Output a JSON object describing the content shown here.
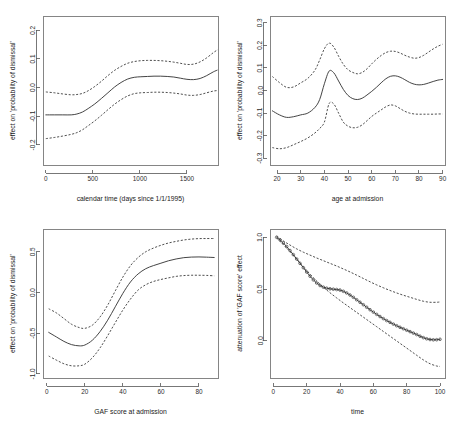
{
  "figure": {
    "title": "",
    "layout": "2x2 panel of smooth term effect plots with pointwise confidence bands",
    "background_color": "#ffffff",
    "line_color": "#3a3a3a"
  },
  "chart_data": [
    {
      "id": "calendar-time",
      "type": "line",
      "title": "",
      "xlabel": "calendar time (days since 1/1/1995)",
      "ylabel": "effect on 'probability of dismissal'",
      "xlim": [
        -30,
        1830
      ],
      "ylim": [
        -0.27,
        0.25
      ],
      "xticks": [
        0,
        500,
        1000,
        1500
      ],
      "xtick_labels": [
        "0",
        "500",
        "1000",
        "1500"
      ],
      "yticks": [
        0.2,
        0.1,
        0.0,
        -0.1,
        -0.2
      ],
      "ytick_labels": [
        "0.2",
        "0.1",
        "0.0",
        "-0.1",
        "-0.2"
      ],
      "grid": false,
      "legend": "none",
      "series": [
        {
          "name": "fit",
          "style": "solid",
          "x": [
            0,
            90,
            180,
            270,
            330,
            390,
            450,
            520,
            590,
            660,
            730,
            800,
            870,
            940,
            1010,
            1080,
            1150,
            1220,
            1290,
            1360,
            1430,
            1500,
            1570,
            1640,
            1710,
            1780,
            1830
          ],
          "values": [
            -0.095,
            -0.095,
            -0.095,
            -0.095,
            -0.092,
            -0.085,
            -0.073,
            -0.057,
            -0.038,
            -0.018,
            0.002,
            0.018,
            0.03,
            0.036,
            0.038,
            0.039,
            0.04,
            0.04,
            0.039,
            0.037,
            0.033,
            0.029,
            0.028,
            0.032,
            0.042,
            0.055,
            0.062
          ]
        },
        {
          "name": "upper confidence band",
          "style": "dashed",
          "x": [
            0,
            90,
            180,
            270,
            330,
            390,
            450,
            520,
            590,
            660,
            730,
            800,
            870,
            940,
            1010,
            1080,
            1150,
            1220,
            1290,
            1360,
            1430,
            1500,
            1570,
            1640,
            1710,
            1780,
            1830
          ],
          "values": [
            -0.015,
            -0.018,
            -0.022,
            -0.025,
            -0.024,
            -0.02,
            -0.011,
            0.004,
            0.022,
            0.042,
            0.06,
            0.074,
            0.085,
            0.091,
            0.094,
            0.095,
            0.095,
            0.094,
            0.092,
            0.089,
            0.085,
            0.081,
            0.082,
            0.09,
            0.104,
            0.122,
            0.133
          ]
        },
        {
          "name": "lower confidence band",
          "style": "dashed",
          "x": [
            0,
            90,
            180,
            270,
            330,
            390,
            450,
            520,
            590,
            660,
            730,
            800,
            870,
            940,
            1010,
            1080,
            1150,
            1220,
            1290,
            1360,
            1430,
            1500,
            1570,
            1640,
            1710,
            1780,
            1830
          ],
          "values": [
            -0.178,
            -0.174,
            -0.169,
            -0.163,
            -0.157,
            -0.147,
            -0.133,
            -0.116,
            -0.097,
            -0.077,
            -0.058,
            -0.042,
            -0.029,
            -0.021,
            -0.018,
            -0.017,
            -0.016,
            -0.016,
            -0.017,
            -0.019,
            -0.022,
            -0.026,
            -0.027,
            -0.024,
            -0.018,
            -0.012,
            -0.01
          ]
        }
      ]
    },
    {
      "id": "age-at-admission",
      "type": "line",
      "title": "",
      "xlabel": "age at admission",
      "ylabel": "effect on 'probability of dismissal'",
      "xlim": [
        17,
        91
      ],
      "ylim": [
        -0.33,
        0.33
      ],
      "xticks": [
        20,
        30,
        40,
        50,
        60,
        70,
        80,
        90
      ],
      "xtick_labels": [
        "20",
        "30",
        "40",
        "50",
        "60",
        "70",
        "80",
        "90"
      ],
      "yticks": [
        0.3,
        0.2,
        0.1,
        0.0,
        -0.1,
        -0.2,
        -0.3
      ],
      "ytick_labels": [
        "0.3",
        "0.2",
        "0.1",
        "0.0",
        "-0.1",
        "-0.2",
        "-0.3"
      ],
      "grid": false,
      "legend": "none",
      "series": [
        {
          "name": "fit",
          "style": "solid",
          "x": [
            18,
            21,
            24,
            27,
            30,
            33,
            36,
            38,
            40,
            42,
            44,
            46,
            48,
            50,
            52,
            54,
            56,
            58,
            60,
            62,
            64,
            66,
            68,
            70,
            72,
            74,
            76,
            78,
            80,
            82,
            84,
            86,
            88,
            90
          ],
          "values": [
            -0.09,
            -0.108,
            -0.119,
            -0.116,
            -0.108,
            -0.1,
            -0.075,
            -0.04,
            0.03,
            0.086,
            0.078,
            0.042,
            0.005,
            -0.022,
            -0.036,
            -0.04,
            -0.034,
            -0.02,
            -0.004,
            0.014,
            0.034,
            0.052,
            0.063,
            0.065,
            0.059,
            0.048,
            0.036,
            0.028,
            0.025,
            0.027,
            0.033,
            0.04,
            0.046,
            0.049
          ]
        },
        {
          "name": "upper confidence band",
          "style": "dashed",
          "x": [
            18,
            21,
            24,
            27,
            30,
            33,
            36,
            38,
            40,
            42,
            44,
            46,
            48,
            50,
            52,
            54,
            56,
            58,
            60,
            62,
            64,
            66,
            68,
            70,
            72,
            74,
            76,
            78,
            80,
            82,
            84,
            86,
            88,
            90
          ],
          "values": [
            0.062,
            0.035,
            0.014,
            0.016,
            0.034,
            0.054,
            0.09,
            0.135,
            0.185,
            0.21,
            0.192,
            0.152,
            0.116,
            0.092,
            0.08,
            0.074,
            0.08,
            0.096,
            0.118,
            0.138,
            0.155,
            0.168,
            0.174,
            0.173,
            0.166,
            0.156,
            0.148,
            0.143,
            0.146,
            0.156,
            0.17,
            0.184,
            0.196,
            0.205
          ]
        },
        {
          "name": "lower confidence band",
          "style": "dashed",
          "x": [
            18,
            21,
            24,
            27,
            30,
            33,
            36,
            38,
            40,
            42,
            44,
            46,
            48,
            50,
            52,
            54,
            56,
            58,
            60,
            62,
            64,
            66,
            68,
            70,
            72,
            74,
            76,
            78,
            80,
            82,
            84,
            86,
            88,
            90
          ],
          "values": [
            -0.253,
            -0.258,
            -0.253,
            -0.24,
            -0.226,
            -0.21,
            -0.188,
            -0.168,
            -0.14,
            -0.058,
            -0.06,
            -0.1,
            -0.14,
            -0.158,
            -0.165,
            -0.163,
            -0.152,
            -0.134,
            -0.115,
            -0.1,
            -0.086,
            -0.072,
            -0.064,
            -0.068,
            -0.08,
            -0.092,
            -0.1,
            -0.104,
            -0.105,
            -0.105,
            -0.105,
            -0.105,
            -0.104,
            -0.104
          ]
        }
      ]
    },
    {
      "id": "gaf-score-at-admission",
      "type": "line",
      "title": "",
      "xlabel": "GAF score at admission",
      "ylabel": "effect on 'probability of dismissal'",
      "xlim": [
        -2,
        90
      ],
      "ylim": [
        -1.05,
        0.78
      ],
      "xticks": [
        0,
        20,
        40,
        60,
        80
      ],
      "xtick_labels": [
        "0",
        "20",
        "40",
        "60",
        "80"
      ],
      "yticks": [
        0.5,
        0.0,
        -0.5,
        -1.0
      ],
      "ytick_labels": [
        "0.5",
        "0.0",
        "-0.5",
        "-1.0"
      ],
      "grid": false,
      "legend": "none",
      "series": [
        {
          "name": "fit",
          "style": "solid",
          "x": [
            1,
            5,
            9,
            13,
            17,
            20,
            24,
            28,
            32,
            36,
            40,
            44,
            48,
            52,
            56,
            60,
            64,
            68,
            72,
            76,
            80,
            84,
            88
          ],
          "values": [
            -0.49,
            -0.545,
            -0.6,
            -0.64,
            -0.655,
            -0.645,
            -0.585,
            -0.48,
            -0.34,
            -0.175,
            -0.01,
            0.13,
            0.228,
            0.292,
            0.33,
            0.36,
            0.39,
            0.412,
            0.428,
            0.435,
            0.437,
            0.434,
            0.43
          ]
        },
        {
          "name": "upper confidence band",
          "style": "dashed",
          "x": [
            1,
            5,
            9,
            13,
            17,
            20,
            24,
            28,
            32,
            36,
            40,
            44,
            48,
            52,
            56,
            60,
            64,
            68,
            72,
            76,
            80,
            84,
            88
          ],
          "values": [
            -0.2,
            -0.25,
            -0.32,
            -0.39,
            -0.43,
            -0.44,
            -0.4,
            -0.3,
            -0.155,
            0.02,
            0.19,
            0.33,
            0.43,
            0.5,
            0.545,
            0.58,
            0.608,
            0.628,
            0.645,
            0.656,
            0.662,
            0.663,
            0.663
          ]
        },
        {
          "name": "lower confidence band",
          "style": "dashed",
          "x": [
            1,
            5,
            9,
            13,
            17,
            20,
            24,
            28,
            32,
            36,
            40,
            44,
            48,
            52,
            56,
            60,
            64,
            68,
            72,
            76,
            80,
            84,
            88
          ],
          "values": [
            -0.78,
            -0.83,
            -0.875,
            -0.9,
            -0.9,
            -0.88,
            -0.8,
            -0.68,
            -0.53,
            -0.37,
            -0.215,
            -0.08,
            0.03,
            0.095,
            0.135,
            0.16,
            0.18,
            0.198,
            0.208,
            0.212,
            0.212,
            0.21,
            0.205
          ]
        }
      ]
    },
    {
      "id": "attenuation-over-time",
      "type": "line",
      "title": "",
      "xlabel": "time",
      "ylabel": "attenuation of 'GAF score' effect",
      "xlim": [
        -2,
        103
      ],
      "ylim": [
        -0.36,
        1.08
      ],
      "xticks": [
        0,
        20,
        40,
        60,
        80,
        100
      ],
      "xtick_labels": [
        "0",
        "20",
        "40",
        "60",
        "80",
        "100"
      ],
      "yticks": [
        1.0,
        0.5,
        0.0
      ],
      "ytick_labels": [
        "1.0",
        "0.5",
        "0.0"
      ],
      "grid": false,
      "legend": "none",
      "marker": "open-circle",
      "series": [
        {
          "name": "fit",
          "style": "points",
          "x": [
            2,
            4,
            6,
            8,
            10,
            12,
            14,
            16,
            18,
            20,
            22,
            24,
            26,
            28,
            30,
            32,
            34,
            36,
            38,
            40,
            42,
            44,
            46,
            48,
            50,
            52,
            54,
            56,
            58,
            60,
            62,
            64,
            66,
            68,
            70,
            72,
            74,
            76,
            78,
            80,
            82,
            84,
            86,
            88,
            90,
            92,
            94,
            96,
            98,
            100
          ],
          "values": [
            1.0,
            0.975,
            0.945,
            0.91,
            0.872,
            0.832,
            0.79,
            0.748,
            0.706,
            0.664,
            0.624,
            0.588,
            0.558,
            0.534,
            0.518,
            0.508,
            0.502,
            0.498,
            0.495,
            0.49,
            0.478,
            0.462,
            0.442,
            0.42,
            0.396,
            0.372,
            0.348,
            0.324,
            0.3,
            0.277,
            0.255,
            0.234,
            0.214,
            0.195,
            0.178,
            0.161,
            0.145,
            0.13,
            0.116,
            0.102,
            0.088,
            0.074,
            0.06,
            0.044,
            0.03,
            0.019,
            0.012,
            0.009,
            0.01,
            0.014
          ]
        },
        {
          "name": "upper confidence band",
          "style": "dashed",
          "x": [
            2,
            6,
            10,
            14,
            18,
            22,
            26,
            30,
            34,
            38,
            42,
            46,
            50,
            54,
            58,
            62,
            66,
            70,
            74,
            78,
            82,
            86,
            90,
            94,
            98,
            100
          ],
          "values": [
            1.01,
            0.965,
            0.925,
            0.888,
            0.856,
            0.828,
            0.8,
            0.774,
            0.748,
            0.722,
            0.694,
            0.665,
            0.634,
            0.602,
            0.57,
            0.54,
            0.512,
            0.486,
            0.462,
            0.44,
            0.42,
            0.4,
            0.382,
            0.372,
            0.372,
            0.375
          ]
        },
        {
          "name": "lower confidence band",
          "style": "dashed",
          "x": [
            2,
            6,
            10,
            14,
            18,
            22,
            26,
            30,
            34,
            38,
            42,
            46,
            50,
            54,
            58,
            62,
            66,
            70,
            74,
            78,
            82,
            86,
            90,
            94,
            98,
            100
          ],
          "values": [
            0.992,
            0.93,
            0.862,
            0.79,
            0.716,
            0.644,
            0.578,
            0.518,
            0.464,
            0.414,
            0.366,
            0.32,
            0.274,
            0.228,
            0.182,
            0.136,
            0.09,
            0.044,
            -0.002,
            -0.048,
            -0.094,
            -0.14,
            -0.185,
            -0.222,
            -0.244,
            -0.248
          ]
        }
      ]
    }
  ]
}
